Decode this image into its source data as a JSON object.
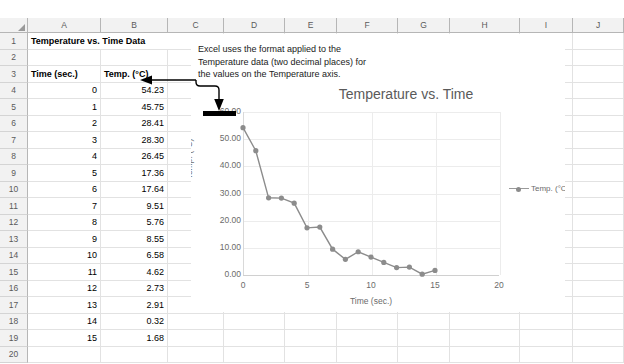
{
  "app": {
    "name": "spreadsheet",
    "column_headers": [
      "A",
      "B",
      "C",
      "D",
      "E",
      "F",
      "G",
      "H",
      "I",
      "J"
    ],
    "row_headers": [
      "1",
      "2",
      "3",
      "4",
      "5",
      "6",
      "7",
      "8",
      "9",
      "10",
      "11",
      "12",
      "13",
      "14",
      "15",
      "16",
      "17",
      "18",
      "19",
      "20"
    ]
  },
  "sheet": {
    "title_cell": "Temperature vs. Time Data",
    "headers": {
      "col_a": "Time (sec.)",
      "col_b": "Temp. (°C)"
    },
    "rows": [
      {
        "row": "4",
        "time": "0",
        "temp": "54.23"
      },
      {
        "row": "5",
        "time": "1",
        "temp": "45.75"
      },
      {
        "row": "6",
        "time": "2",
        "temp": "28.41"
      },
      {
        "row": "7",
        "time": "3",
        "temp": "28.30"
      },
      {
        "row": "8",
        "time": "4",
        "temp": "26.45"
      },
      {
        "row": "9",
        "time": "5",
        "temp": "17.36"
      },
      {
        "row": "10",
        "time": "6",
        "temp": "17.64"
      },
      {
        "row": "11",
        "time": "7",
        "temp": "9.51"
      },
      {
        "row": "12",
        "time": "8",
        "temp": "5.76"
      },
      {
        "row": "13",
        "time": "9",
        "temp": "8.55"
      },
      {
        "row": "14",
        "time": "10",
        "temp": "6.58"
      },
      {
        "row": "15",
        "time": "11",
        "temp": "4.62"
      },
      {
        "row": "16",
        "time": "12",
        "temp": "2.73"
      },
      {
        "row": "17",
        "time": "13",
        "temp": "2.91"
      },
      {
        "row": "18",
        "time": "14",
        "temp": "0.32"
      },
      {
        "row": "19",
        "time": "15",
        "temp": "1.68"
      }
    ]
  },
  "annotation": {
    "line1": "Excel uses the format applied to the",
    "line2": "Temperature data (two decimal places) for",
    "line3": "the values on the Temperature axis."
  },
  "chart_data": {
    "type": "line",
    "title": "Temperature vs. Time",
    "xlabel": "Time (sec.)",
    "ylabel": "Temp. (°C)",
    "legend": [
      "Temp. (°C)"
    ],
    "legend_position": "right",
    "grid": true,
    "xlim": [
      0,
      20
    ],
    "ylim": [
      0,
      60
    ],
    "xticks": [
      "0",
      "5",
      "10",
      "15",
      "20"
    ],
    "yticks": [
      "0.00",
      "10.00",
      "20.00",
      "30.00",
      "40.00",
      "50.00",
      "60.00"
    ],
    "x": [
      0,
      1,
      2,
      3,
      4,
      5,
      6,
      7,
      8,
      9,
      10,
      11,
      12,
      13,
      14,
      15
    ],
    "series": [
      {
        "name": "Temp. (°C)",
        "values": [
          54.23,
          45.75,
          28.41,
          28.3,
          26.45,
          17.36,
          17.64,
          9.51,
          5.76,
          8.55,
          6.58,
          4.62,
          2.73,
          2.91,
          0.32,
          1.68
        ]
      }
    ]
  },
  "colors": {
    "series": "#8c8c8c",
    "grid": "#ececec",
    "header_bg": "#f2f2f2",
    "highlight": "#000000"
  }
}
